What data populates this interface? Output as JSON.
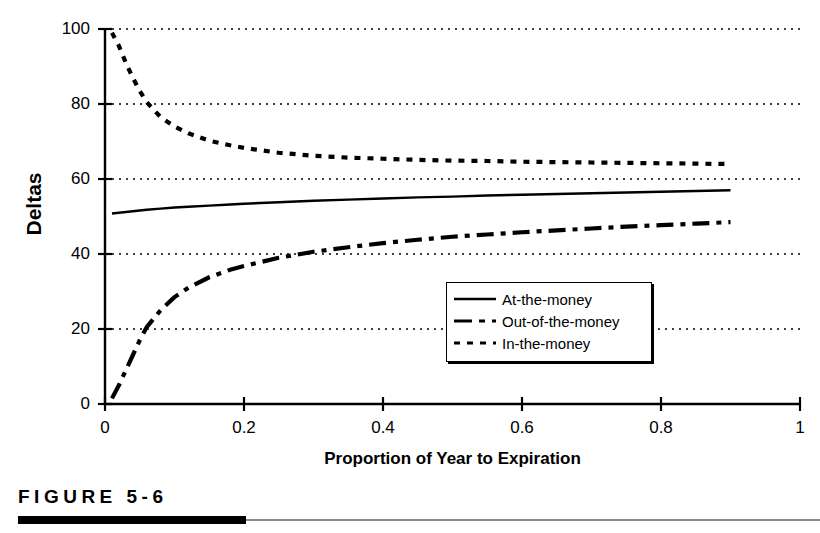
{
  "figure": {
    "caption": "FIGURE  5-6",
    "caption_rule_color": "#000000"
  },
  "chart_data": {
    "type": "line",
    "title": "",
    "xlabel": "Proportion of Year to Expiration",
    "ylabel": "Deltas",
    "xlim": [
      0,
      1
    ],
    "ylim": [
      0,
      100
    ],
    "xticks": [
      0,
      0.2,
      0.4,
      0.6,
      0.8,
      1
    ],
    "xtick_labels": [
      "0",
      "0.2",
      "0.4",
      "0.6",
      "0.8",
      "1"
    ],
    "yticks": [
      0,
      20,
      40,
      60,
      80,
      100
    ],
    "ytick_labels": [
      "0",
      "20",
      "40",
      "60",
      "80",
      "100"
    ],
    "grid": true,
    "grid_style": "dotted",
    "grid_axis": "y",
    "grid_color": "#000000",
    "legend_position": "center-right-inside",
    "x": [
      0.01,
      0.02,
      0.03,
      0.04,
      0.05,
      0.06,
      0.08,
      0.1,
      0.12,
      0.15,
      0.18,
      0.2,
      0.25,
      0.3,
      0.35,
      0.4,
      0.45,
      0.5,
      0.55,
      0.6,
      0.65,
      0.7,
      0.75,
      0.8,
      0.85,
      0.9
    ],
    "series": [
      {
        "name": "At-the-money",
        "style": "solid",
        "color": "#000000",
        "values": [
          50.8,
          51.0,
          51.2,
          51.4,
          51.6,
          51.8,
          52.1,
          52.4,
          52.6,
          52.9,
          53.2,
          53.4,
          53.8,
          54.2,
          54.5,
          54.8,
          55.1,
          55.3,
          55.6,
          55.8,
          56.0,
          56.2,
          56.4,
          56.6,
          56.8,
          57.0
        ]
      },
      {
        "name": "Out-of-the-money",
        "style": "dash-dot",
        "color": "#000000",
        "values": [
          1.5,
          5.0,
          9.0,
          13.0,
          17.0,
          20.5,
          25.0,
          28.5,
          31.0,
          33.8,
          35.8,
          36.8,
          39.0,
          40.6,
          41.8,
          42.9,
          43.8,
          44.6,
          45.2,
          45.8,
          46.3,
          46.8,
          47.3,
          47.7,
          48.1,
          48.5
        ]
      },
      {
        "name": "In-the-money",
        "style": "dotted",
        "color": "#000000",
        "values": [
          99.0,
          95.5,
          91.0,
          87.0,
          83.5,
          80.5,
          76.5,
          74.0,
          72.2,
          70.2,
          69.0,
          68.3,
          67.0,
          66.2,
          65.7,
          65.4,
          65.1,
          64.9,
          64.8,
          64.6,
          64.5,
          64.4,
          64.3,
          64.2,
          64.1,
          64.0
        ]
      }
    ]
  }
}
